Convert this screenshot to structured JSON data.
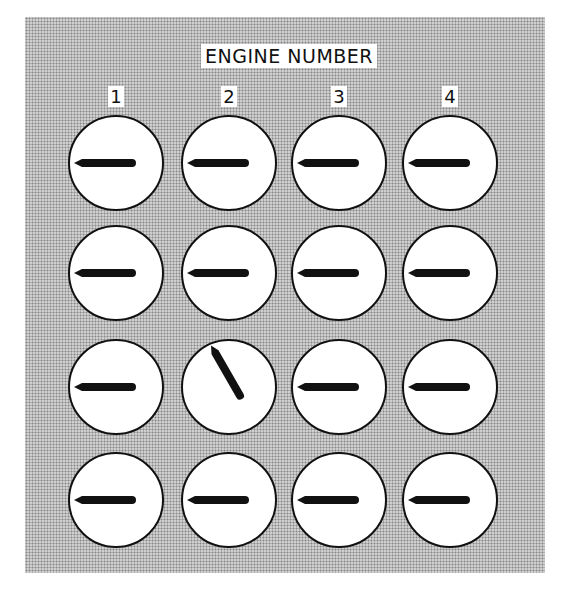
{
  "title": "ENGINE NUMBER",
  "columns": [
    {
      "label": "1",
      "x": 116
    },
    {
      "label": "2",
      "x": 229
    },
    {
      "label": "3",
      "x": 339
    },
    {
      "label": "4",
      "x": 450
    }
  ],
  "rows": [
    {
      "y": 163,
      "angles": [
        180,
        180,
        180,
        180
      ]
    },
    {
      "y": 273,
      "angles": [
        180,
        180,
        180,
        180
      ]
    },
    {
      "y": 387,
      "angles": [
        180,
        240,
        180,
        180
      ]
    },
    {
      "y": 500,
      "angles": [
        180,
        180,
        180,
        180
      ]
    }
  ],
  "colors": {
    "needle": "#111111",
    "dial_face": "#ffffff",
    "panel_bg": "#cfcfcf"
  }
}
